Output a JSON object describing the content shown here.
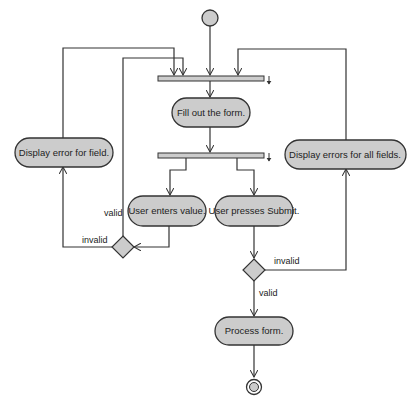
{
  "diagram": {
    "type": "uml-activity",
    "colors": {
      "node_fill": "#cccccc",
      "stroke": "#333333",
      "background": "#ffffff"
    },
    "nodes": {
      "initial": {
        "kind": "initial"
      },
      "fork_top": {
        "kind": "bar"
      },
      "fill_form": {
        "kind": "action",
        "label": "Fill out the form."
      },
      "fork_mid": {
        "kind": "bar"
      },
      "display_error_field": {
        "kind": "action",
        "label": "Display error for field."
      },
      "display_errors_all": {
        "kind": "action",
        "label": "Display errors for all fields."
      },
      "user_enters": {
        "kind": "action",
        "label": "User enters value."
      },
      "user_submits": {
        "kind": "action",
        "label": "User presses Submit."
      },
      "decision_left": {
        "kind": "decision"
      },
      "decision_right": {
        "kind": "decision"
      },
      "process_form": {
        "kind": "action",
        "label": "Process form."
      },
      "final": {
        "kind": "final"
      }
    },
    "edge_labels": {
      "left_valid": "valid",
      "left_invalid": "invalid",
      "right_invalid": "invalid",
      "right_valid": "valid"
    }
  }
}
